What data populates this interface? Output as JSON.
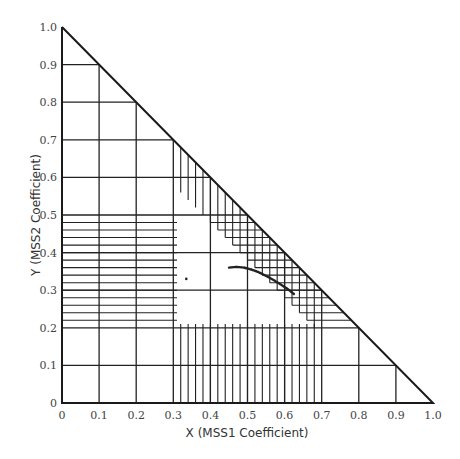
{
  "chart_data": {
    "type": "scatter",
    "title": "",
    "xlabel": "X (MSS1 Coefficient)",
    "ylabel": "Y (MSS2 Coefficient)",
    "xlim": [
      0,
      1.0
    ],
    "ylim": [
      0,
      1.0
    ],
    "x_ticks": [
      "0",
      "0.1",
      "0.2",
      "0.3",
      "0.4",
      "0.5",
      "0.6",
      "0.7",
      "0.8",
      "0.9",
      "1.0"
    ],
    "y_ticks": [
      "0",
      "0.1",
      "0.2",
      "0.3",
      "0.4",
      "0.5",
      "0.6",
      "0.7",
      "0.8",
      "0.9",
      "1.0"
    ],
    "boundary": "triangle x + y <= 1",
    "grid": {
      "coarse_step": 0.1,
      "fine_x_range": [
        0.3,
        0.7
      ],
      "fine_y_range": [
        0.2,
        0.5
      ],
      "fine_step": 0.02
    },
    "series": [
      {
        "name": "coefficient locus",
        "points": [
          [
            0.45,
            0.36
          ],
          [
            0.47,
            0.362
          ],
          [
            0.49,
            0.36
          ],
          [
            0.51,
            0.355
          ],
          [
            0.53,
            0.348
          ],
          [
            0.55,
            0.338
          ],
          [
            0.57,
            0.327
          ],
          [
            0.59,
            0.315
          ],
          [
            0.61,
            0.302
          ],
          [
            0.625,
            0.29
          ]
        ]
      },
      {
        "name": "isolated point",
        "points": [
          [
            0.335,
            0.33
          ]
        ]
      }
    ]
  },
  "labels": {
    "xlabel": "X (MSS1 Coefficient)",
    "ylabel": "Y (MSS2 Coefficient)"
  }
}
